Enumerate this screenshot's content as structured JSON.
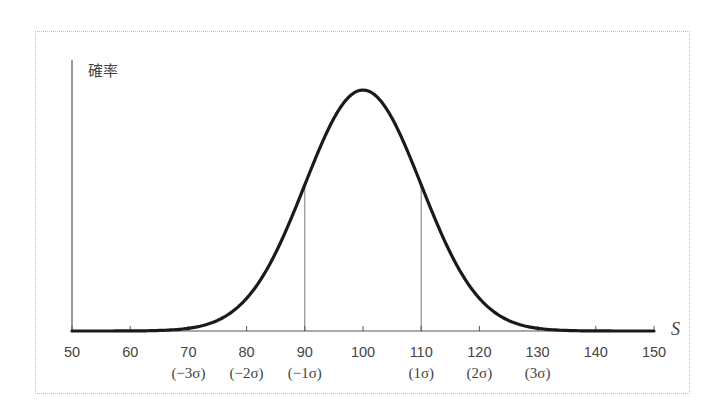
{
  "chart_data": {
    "type": "line",
    "title": "",
    "ylabel": "確率",
    "xlabel": "S",
    "distribution": "normal",
    "mean": 100,
    "sigma": 10,
    "xlim": [
      50,
      150
    ],
    "grid": false,
    "legend": null,
    "x_ticks": [
      50,
      60,
      70,
      80,
      90,
      100,
      110,
      120,
      130,
      140,
      150
    ],
    "x_tick_labels": [
      "50",
      "60",
      "70",
      "80",
      "90",
      "100",
      "110",
      "120",
      "130",
      "140",
      "150"
    ],
    "sigma_labels": [
      {
        "x": 70,
        "label": "(−3σ)"
      },
      {
        "x": 80,
        "label": "(−2σ)"
      },
      {
        "x": 90,
        "label": "(−1σ)"
      },
      {
        "x": 110,
        "label": "(1σ)"
      },
      {
        "x": 120,
        "label": "(2σ)"
      },
      {
        "x": 130,
        "label": "(3σ)"
      }
    ],
    "reference_lines": [
      90,
      110
    ],
    "series": [
      {
        "name": "確率密度",
        "x": [
          50,
          60,
          70,
          75,
          80,
          85,
          90,
          95,
          100,
          105,
          110,
          115,
          120,
          125,
          130,
          140,
          150
        ],
        "values": [
          0.0,
          0.0001,
          0.0044,
          0.0175,
          0.054,
          0.1295,
          0.242,
          0.3521,
          0.3989,
          0.3521,
          0.242,
          0.1295,
          0.054,
          0.0175,
          0.0044,
          0.0001,
          0.0
        ]
      }
    ]
  },
  "colors": {
    "curve": "#1a1a1a",
    "axis": "#555555",
    "ref_line": "#777777",
    "text": "#444444",
    "frame": "#bdbdbd"
  }
}
